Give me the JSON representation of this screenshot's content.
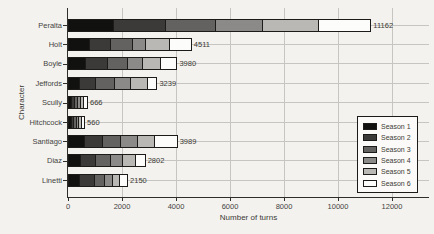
{
  "chart_data": {
    "type": "bar",
    "orientation": "horizontal",
    "stacked": true,
    "title": "",
    "xlabel": "Number of turns",
    "ylabel": "Character",
    "xlim": [
      0,
      13370
    ],
    "xticks": [
      0,
      2000,
      4000,
      6000,
      8000,
      10000,
      12000
    ],
    "grid": true,
    "categories": [
      "Peralta",
      "Holt",
      "Boyle",
      "Jeffords",
      "Scully",
      "Hitchcock",
      "Santiago",
      "Diaz",
      "Linetti"
    ],
    "totals": [
      11162,
      4511,
      3980,
      3239,
      666,
      560,
      3989,
      2802,
      2150
    ],
    "total_labels": [
      "11162",
      "4511",
      "3980",
      "3239",
      "666",
      "560",
      "3989",
      "2802",
      "2150"
    ],
    "series": [
      {
        "name": "Season 1",
        "color": "#111110",
        "values": [
          1680,
          763,
          641,
          393,
          111,
          93,
          578,
          456,
          393
        ]
      },
      {
        "name": "Season 2",
        "color": "#3b3a38",
        "values": [
          1925,
          804,
          804,
          618,
          111,
          94,
          681,
          555,
          555
        ]
      },
      {
        "name": "Season 3",
        "color": "#636260",
        "values": [
          1850,
          803,
          740,
          678,
          111,
          93,
          678,
          556,
          371
        ]
      },
      {
        "name": "Season 4",
        "color": "#8b8a88",
        "values": [
          1740,
          493,
          556,
          619,
          111,
          93,
          619,
          433,
          311
        ]
      },
      {
        "name": "Season 5",
        "color": "#b9b8b5",
        "values": [
          2075,
          863,
          677,
          618,
          111,
          94,
          615,
          493,
          244
        ]
      },
      {
        "name": "Season 6",
        "color": "#fcfcfa",
        "values": [
          1892,
          785,
          562,
          313,
          111,
          93,
          818,
          309,
          276
        ]
      }
    ],
    "legend": {
      "position": "lower right",
      "entries": [
        "Season 1",
        "Season 2",
        "Season 3",
        "Season 4",
        "Season 5",
        "Season 6"
      ]
    }
  },
  "colors": {
    "background": "#f3f2ee",
    "gridline": "#c6c5c1",
    "axis": "#2f2e2b",
    "bar_border": "#1c1b19",
    "text": "#45433f"
  }
}
